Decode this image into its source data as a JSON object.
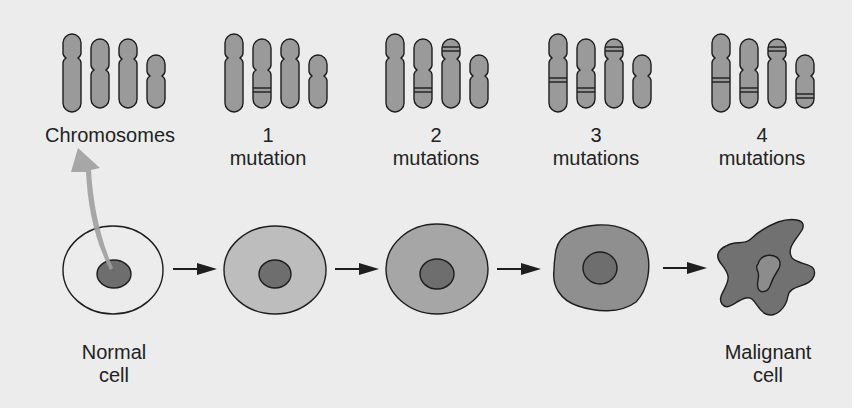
{
  "colors": {
    "background": "#ececec",
    "chromosome_fill": "#9a9a9a",
    "outline": "#1e1e1e",
    "normal_cytoplasm": "#ececec",
    "cytoplasm_stage1": "#bdbdbd",
    "cytoplasm_stage2": "#a6a6a6",
    "cytoplasm_stage3": "#8f8f8f",
    "malignant_cytoplasm": "#717171",
    "nucleus": "#6e6e6e",
    "malignant_nucleus": "#8c8c8c",
    "curved_arrow": "#a0a0a0"
  },
  "stages": [
    {
      "id": "chromosomes",
      "number": "",
      "label": "Chromosomes",
      "x": 110
    },
    {
      "id": "mutation-1",
      "number": "1",
      "label": "mutation",
      "x": 268
    },
    {
      "id": "mutation-2",
      "number": "2",
      "label": "mutations",
      "x": 436
    },
    {
      "id": "mutation-3",
      "number": "3",
      "label": "mutations",
      "x": 596
    },
    {
      "id": "mutation-4",
      "number": "4",
      "label": "mutations",
      "x": 762
    }
  ],
  "cells": [
    {
      "id": "normal-cell",
      "label_line1": "Normal",
      "label_line2": "cell"
    },
    {
      "id": "cell-1-mutation"
    },
    {
      "id": "cell-2-mutations"
    },
    {
      "id": "cell-3-mutations"
    },
    {
      "id": "malignant-cell",
      "label_line1": "Malignant",
      "label_line2": "cell"
    }
  ]
}
